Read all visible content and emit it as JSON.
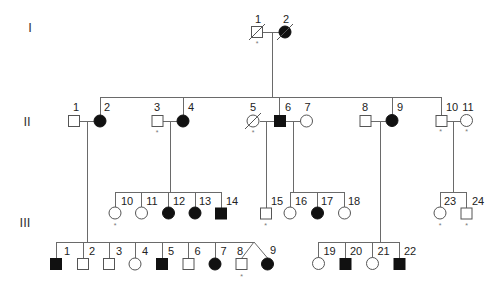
{
  "figure": {
    "type": "pedigree",
    "colors": {
      "line": "#6a6a6a",
      "affected": "#111111",
      "unaffected": "#ffffff"
    }
  },
  "generations": [
    {
      "label": "I",
      "individuals": [
        {
          "num": "1",
          "sex": "male",
          "affected": false,
          "deceased": true,
          "marker": "*"
        },
        {
          "num": "2",
          "sex": "female",
          "affected": true,
          "deceased": true,
          "marker": ""
        }
      ]
    },
    {
      "label": "II",
      "individuals": [
        {
          "num": "1",
          "sex": "male",
          "affected": false,
          "deceased": false,
          "marker": ""
        },
        {
          "num": "2",
          "sex": "female",
          "affected": true,
          "deceased": false,
          "marker": ""
        },
        {
          "num": "3",
          "sex": "male",
          "affected": false,
          "deceased": false,
          "marker": "*"
        },
        {
          "num": "4",
          "sex": "female",
          "affected": true,
          "deceased": false,
          "marker": ""
        },
        {
          "num": "5",
          "sex": "female",
          "affected": false,
          "deceased": true,
          "marker": "*"
        },
        {
          "num": "6",
          "sex": "male",
          "affected": true,
          "deceased": false,
          "marker": ""
        },
        {
          "num": "7",
          "sex": "female",
          "affected": false,
          "deceased": false,
          "marker": ""
        },
        {
          "num": "8",
          "sex": "male",
          "affected": false,
          "deceased": false,
          "marker": ""
        },
        {
          "num": "9",
          "sex": "female",
          "affected": true,
          "deceased": false,
          "marker": ""
        },
        {
          "num": "10",
          "sex": "male",
          "affected": false,
          "deceased": false,
          "marker": "*"
        },
        {
          "num": "11",
          "sex": "female",
          "affected": false,
          "deceased": false,
          "marker": "*"
        }
      ]
    },
    {
      "label": "III",
      "individuals": [
        {
          "num": "1",
          "sex": "male",
          "affected": true,
          "deceased": false,
          "marker": ""
        },
        {
          "num": "2",
          "sex": "male",
          "affected": false,
          "deceased": false,
          "marker": ""
        },
        {
          "num": "3",
          "sex": "male",
          "affected": false,
          "deceased": false,
          "marker": ""
        },
        {
          "num": "4",
          "sex": "female",
          "affected": false,
          "deceased": false,
          "marker": ""
        },
        {
          "num": "5",
          "sex": "male",
          "affected": true,
          "deceased": false,
          "marker": ""
        },
        {
          "num": "6",
          "sex": "male",
          "affected": false,
          "deceased": false,
          "marker": ""
        },
        {
          "num": "7",
          "sex": "female",
          "affected": true,
          "deceased": false,
          "marker": ""
        },
        {
          "num": "8",
          "sex": "male",
          "affected": false,
          "deceased": false,
          "marker": "*",
          "twin_of": "9"
        },
        {
          "num": "9",
          "sex": "female",
          "affected": true,
          "deceased": false,
          "marker": "",
          "twin_of": "8"
        },
        {
          "num": "10",
          "sex": "female",
          "affected": false,
          "deceased": false,
          "marker": "*"
        },
        {
          "num": "11",
          "sex": "female",
          "affected": false,
          "deceased": false,
          "marker": ""
        },
        {
          "num": "12",
          "sex": "female",
          "affected": true,
          "deceased": false,
          "marker": ""
        },
        {
          "num": "13",
          "sex": "female",
          "affected": true,
          "deceased": false,
          "marker": ""
        },
        {
          "num": "14",
          "sex": "male",
          "affected": true,
          "deceased": false,
          "marker": ""
        },
        {
          "num": "15",
          "sex": "male",
          "affected": false,
          "deceased": false,
          "marker": "*"
        },
        {
          "num": "16",
          "sex": "female",
          "affected": false,
          "deceased": false,
          "marker": ""
        },
        {
          "num": "17",
          "sex": "female",
          "affected": true,
          "deceased": false,
          "marker": ""
        },
        {
          "num": "18",
          "sex": "female",
          "affected": false,
          "deceased": false,
          "marker": ""
        },
        {
          "num": "19",
          "sex": "female",
          "affected": false,
          "deceased": false,
          "marker": ""
        },
        {
          "num": "20",
          "sex": "male",
          "affected": true,
          "deceased": false,
          "marker": ""
        },
        {
          "num": "21",
          "sex": "female",
          "affected": false,
          "deceased": false,
          "marker": ""
        },
        {
          "num": "22",
          "sex": "male",
          "affected": true,
          "deceased": false,
          "marker": ""
        },
        {
          "num": "23",
          "sex": "female",
          "affected": false,
          "deceased": false,
          "marker": "*"
        },
        {
          "num": "24",
          "sex": "male",
          "affected": false,
          "deceased": false,
          "marker": "*"
        }
      ]
    }
  ],
  "couples": [
    {
      "partners": [
        "I-1",
        "I-2"
      ],
      "children": [
        "II-2",
        "II-4",
        "II-6",
        "II-9",
        "II-10"
      ]
    },
    {
      "partners": [
        "II-1",
        "II-2"
      ],
      "children": [
        "III-1",
        "III-2",
        "III-3",
        "III-4",
        "III-5",
        "III-6",
        "III-7",
        "III-8",
        "III-9"
      ]
    },
    {
      "partners": [
        "II-3",
        "II-4"
      ],
      "children": [
        "III-10",
        "III-11",
        "III-12",
        "III-13",
        "III-14"
      ]
    },
    {
      "partners": [
        "II-5",
        "II-6"
      ],
      "children": [
        "III-15"
      ]
    },
    {
      "partners": [
        "II-6",
        "II-7"
      ],
      "children": [
        "III-16",
        "III-17",
        "III-18"
      ]
    },
    {
      "partners": [
        "II-8",
        "II-9"
      ],
      "children": [
        "III-19",
        "III-20",
        "III-21",
        "III-22"
      ]
    },
    {
      "partners": [
        "II-10",
        "II-11"
      ],
      "children": [
        "III-23",
        "III-24"
      ]
    }
  ]
}
